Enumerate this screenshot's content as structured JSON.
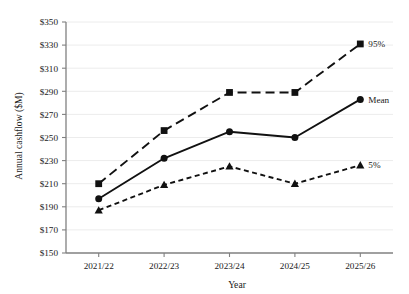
{
  "chart_data": {
    "type": "line",
    "title": "",
    "xlabel": "Year",
    "ylabel": "Annual cashflow ($M)",
    "categories": [
      "2021/22",
      "2022/23",
      "2023/24",
      "2024/25",
      "2025/26"
    ],
    "ylim": [
      150,
      350
    ],
    "ytick_step": 20,
    "ytick_labels": [
      "$150",
      "$170",
      "$190",
      "$210",
      "$230",
      "$250",
      "$270",
      "$290",
      "$310",
      "$330",
      "$350"
    ],
    "ytick_values": [
      150,
      170,
      190,
      210,
      230,
      250,
      270,
      290,
      310,
      330,
      350
    ],
    "grid": true,
    "grid_axis": "y",
    "legend_position": "inline-right-of-last-point",
    "series": [
      {
        "name": "95%",
        "label": "95%",
        "marker": "square",
        "linestyle": "long-dash",
        "color": "#111111",
        "values": [
          210,
          256,
          289,
          289,
          331
        ]
      },
      {
        "name": "Mean",
        "label": "Mean",
        "marker": "circle",
        "linestyle": "solid",
        "color": "#111111",
        "values": [
          197,
          232,
          255,
          250,
          283
        ]
      },
      {
        "name": "5%",
        "label": "5%",
        "marker": "triangle",
        "linestyle": "short-dash",
        "color": "#111111",
        "values": [
          187,
          209,
          225,
          210,
          226
        ]
      }
    ]
  },
  "colors": {
    "axis": "#808080",
    "grid": "#ececec",
    "series": "#111111",
    "text": "#1a1a1a",
    "background": "#ffffff"
  }
}
